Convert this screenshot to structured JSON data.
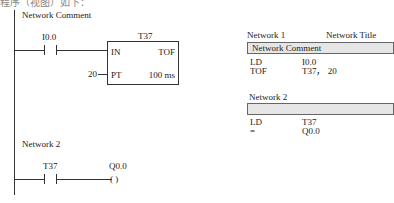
{
  "caption_top": "程序（视图）如下：",
  "ladder": {
    "network1": {
      "comment": "Network Comment",
      "contact": {
        "address": "I0.0",
        "type": "normally-open"
      },
      "timer": {
        "name": "T37",
        "in_label": "IN",
        "type": "TOF",
        "pt_value": "20",
        "pt_label": "PT",
        "resolution": "100 ms"
      }
    },
    "network2": {
      "title": "Network 2",
      "contact": {
        "address": "T37",
        "type": "normally-open"
      },
      "coil": {
        "address": "Q0.0",
        "symbol": "(  )"
      }
    }
  },
  "stl": {
    "network1": {
      "title": "Network 1",
      "network_title": "Network Title",
      "comment": "Network Comment",
      "rows": [
        {
          "op": "LD",
          "operand": "I0.0"
        },
        {
          "op": "TOF",
          "operand": "T37， 20"
        }
      ]
    },
    "network2": {
      "title": "Network 2",
      "comment": "",
      "rows": [
        {
          "op": "LD",
          "operand": "T37"
        },
        {
          "op": "=",
          "operand": "Q0.0"
        }
      ]
    }
  }
}
